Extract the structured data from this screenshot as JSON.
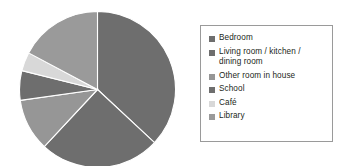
{
  "chart_data": {
    "type": "pie",
    "title": "",
    "subtitle": "",
    "xlabel": "",
    "ylabel": "",
    "grid": false,
    "legend_position": "right",
    "start_angle_deg": 0,
    "direction": "clockwise",
    "categories": [
      "Bedroom",
      "Living room / kitchen / dining room",
      "Other room in house",
      "School",
      "Café",
      "Library"
    ],
    "values": [
      37,
      25,
      11,
      6,
      4,
      17
    ],
    "colors": [
      "#6e6e6e",
      "#6e6e6e",
      "#969696",
      "#6e6e6e",
      "#d8d8d8",
      "#9a9a9a"
    ],
    "slices": [
      {
        "label": "Bedroom",
        "value": 37,
        "color": "#6e6e6e",
        "start_deg": 0,
        "end_deg": 133
      },
      {
        "label": "Living room / kitchen / dining room",
        "value": 25,
        "color": "#6e6e6e",
        "start_deg": 133,
        "end_deg": 223
      },
      {
        "label": "Other room in house",
        "value": 11,
        "color": "#969696",
        "start_deg": 223,
        "end_deg": 262
      },
      {
        "label": "School",
        "value": 6,
        "color": "#6e6e6e",
        "start_deg": 262,
        "end_deg": 284
      },
      {
        "label": "Café",
        "value": 4,
        "color": "#d8d8d8",
        "start_deg": 284,
        "end_deg": 298
      },
      {
        "label": "Library",
        "value": 17,
        "color": "#9a9a9a",
        "start_deg": 298,
        "end_deg": 360
      }
    ]
  },
  "legend": {
    "border_color": "#9a9a9a",
    "background": "#ffffff",
    "items": [
      {
        "label": "Bedroom",
        "color": "#6e6e6e"
      },
      {
        "label": "Living room / kitchen /\ndining room",
        "color": "#6e6e6e"
      },
      {
        "label": "Other room in house",
        "color": "#969696"
      },
      {
        "label": "School",
        "color": "#6e6e6e"
      },
      {
        "label": "Café",
        "color": "#d8d8d8"
      },
      {
        "label": "Library",
        "color": "#9a9a9a"
      }
    ]
  },
  "figure": {
    "background": "#ffffff",
    "separator_color": "#ffffff"
  }
}
